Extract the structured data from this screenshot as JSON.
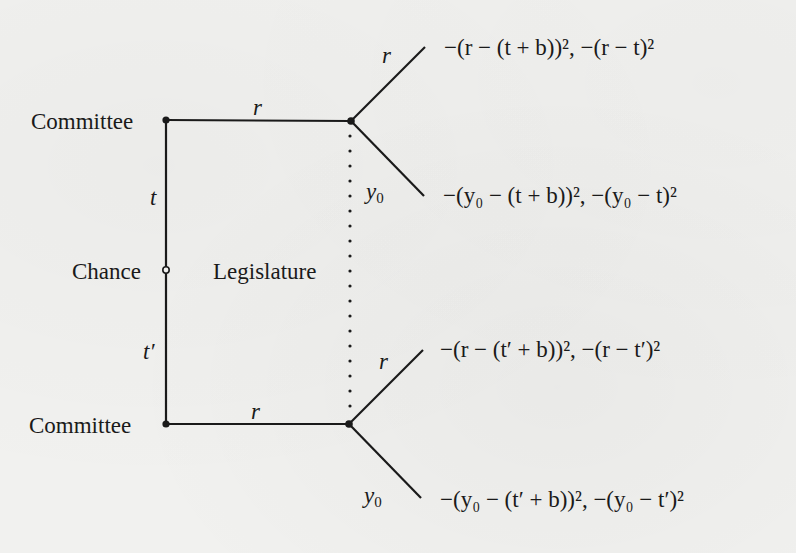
{
  "diagram": {
    "type": "extensive-form game tree",
    "players": {
      "committee_top": "Committee",
      "committee_bottom": "Committee",
      "chance": "Chance",
      "legislature": "Legislature"
    },
    "chance_moves": {
      "top": "t",
      "bottom": "t′"
    },
    "committee_actions": {
      "top": "r",
      "bottom": "r"
    },
    "legislature_actions": {
      "top_up": "r",
      "top_down": "y",
      "top_down_sub": "0",
      "bottom_up": "r",
      "bottom_down": "y",
      "bottom_down_sub": "0"
    },
    "payoffs": [
      {
        "id": "top-r",
        "text": "−(r − (t + b))², −(r − t)²"
      },
      {
        "id": "top-y0",
        "text": "−(y₀ − (t + b))², −(y₀ − t)²"
      },
      {
        "id": "bottom-r",
        "text": "−(r − (t′ + b))², −(r − t′)²"
      },
      {
        "id": "bottom-y0",
        "text": "−(y₀ − (t′ + b))², −(y₀ − t′)²"
      }
    ],
    "colors": {
      "line": "#1a1a1a",
      "background": "#f1f1ef"
    }
  }
}
